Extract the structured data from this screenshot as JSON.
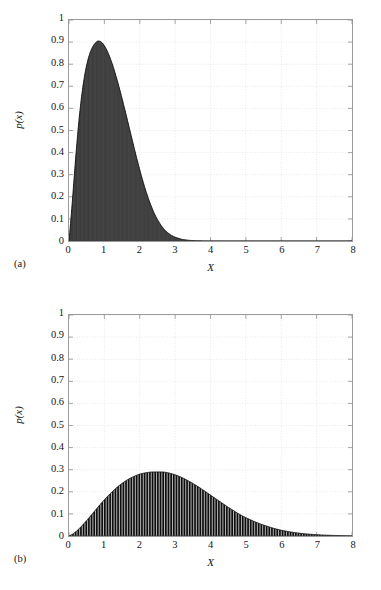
{
  "figure": {
    "background_color": "#ffffff",
    "ink_color": "#0d0d0d",
    "grid_color": "#d8d8d8",
    "axis_color": "#9a9a9a"
  },
  "panels": [
    {
      "tag": "(a)"
    },
    {
      "tag": "(b)"
    }
  ],
  "chart_data": [
    {
      "type": "area",
      "panel": "(a)",
      "title": "",
      "subtitle": "",
      "xlabel": "X",
      "ylabel": "p(x)",
      "xlim": [
        0,
        8
      ],
      "ylim": [
        0,
        1
      ],
      "xticks": [
        0,
        1,
        2,
        3,
        4,
        5,
        6,
        7,
        8
      ],
      "xticklabels": [
        "0",
        "1",
        "2",
        "3",
        "4",
        "5",
        "6",
        "7",
        "8"
      ],
      "yticks": [
        0,
        0.1,
        0.2,
        0.3,
        0.4,
        0.5,
        0.6,
        0.7,
        0.8,
        0.9,
        1
      ],
      "yticklabels": [
        "0",
        "0.1",
        "0.2",
        "0.3",
        "0.4",
        "0.5",
        "0.6",
        "0.7",
        "0.8",
        "0.9",
        "1"
      ],
      "grid": true,
      "legend": null,
      "fill": true,
      "peak": {
        "x": 0.81,
        "y": 0.905
      },
      "x": [
        0.0,
        0.05,
        0.1,
        0.15,
        0.2,
        0.25,
        0.3,
        0.35,
        0.4,
        0.45,
        0.5,
        0.55,
        0.6,
        0.65,
        0.7,
        0.75,
        0.8,
        0.85,
        0.9,
        0.95,
        1.0,
        1.05,
        1.1,
        1.15,
        1.2,
        1.25,
        1.3,
        1.35,
        1.4,
        1.45,
        1.5,
        1.55,
        1.6,
        1.65,
        1.7,
        1.75,
        1.8,
        1.85,
        1.9,
        1.95,
        2.0,
        2.05,
        2.1,
        2.15,
        2.2,
        2.25,
        2.3,
        2.35,
        2.4,
        2.45,
        2.5,
        2.6,
        2.7,
        2.8,
        2.9,
        3.0,
        3.2,
        3.4,
        3.6,
        3.8,
        4.0,
        4.5,
        5.0,
        5.5,
        6.0,
        6.5,
        7.0,
        7.5,
        8.0
      ],
      "y": [
        0.0,
        0.09,
        0.19,
        0.296,
        0.398,
        0.492,
        0.575,
        0.647,
        0.707,
        0.757,
        0.797,
        0.829,
        0.854,
        0.873,
        0.887,
        0.897,
        0.904,
        0.905,
        0.902,
        0.895,
        0.884,
        0.87,
        0.853,
        0.834,
        0.812,
        0.788,
        0.762,
        0.735,
        0.706,
        0.676,
        0.645,
        0.613,
        0.581,
        0.548,
        0.515,
        0.482,
        0.449,
        0.416,
        0.384,
        0.353,
        0.322,
        0.293,
        0.265,
        0.238,
        0.213,
        0.19,
        0.168,
        0.148,
        0.129,
        0.112,
        0.097,
        0.071,
        0.051,
        0.036,
        0.025,
        0.017,
        0.0072,
        0.0029,
        0.0011,
        0.0004,
        0.0001,
        0.0,
        0.0,
        0.0,
        0.0,
        0.0,
        0.0,
        0.0,
        0.0
      ]
    },
    {
      "type": "area",
      "panel": "(b)",
      "title": "",
      "subtitle": "",
      "xlabel": "X",
      "ylabel": "p(x)",
      "xlim": [
        0,
        8
      ],
      "ylim": [
        0,
        1
      ],
      "xticks": [
        0,
        1,
        2,
        3,
        4,
        5,
        6,
        7,
        8
      ],
      "xticklabels": [
        "0",
        "1",
        "2",
        "3",
        "4",
        "5",
        "6",
        "7",
        "8"
      ],
      "yticks": [
        0,
        0.1,
        0.2,
        0.3,
        0.4,
        0.5,
        0.6,
        0.7,
        0.8,
        0.9,
        1
      ],
      "yticklabels": [
        "0",
        "0.1",
        "0.2",
        "0.3",
        "0.4",
        "0.5",
        "0.6",
        "0.7",
        "0.8",
        "0.9",
        "1"
      ],
      "grid": true,
      "legend": null,
      "fill": true,
      "impulses": true,
      "peak": {
        "x": 2.7,
        "y": 0.29
      },
      "x": [
        0.0,
        0.1,
        0.2,
        0.3,
        0.4,
        0.5,
        0.6,
        0.7,
        0.8,
        0.9,
        1.0,
        1.1,
        1.2,
        1.3,
        1.4,
        1.5,
        1.6,
        1.7,
        1.8,
        1.9,
        2.0,
        2.1,
        2.2,
        2.3,
        2.4,
        2.5,
        2.6,
        2.7,
        2.8,
        2.9,
        3.0,
        3.1,
        3.2,
        3.3,
        3.4,
        3.5,
        3.6,
        3.7,
        3.8,
        3.9,
        4.0,
        4.1,
        4.2,
        4.3,
        4.4,
        4.5,
        4.6,
        4.7,
        4.8,
        4.9,
        5.0,
        5.2,
        5.4,
        5.6,
        5.8,
        6.0,
        6.2,
        6.4,
        6.6,
        6.8,
        7.0,
        7.2,
        7.4,
        7.6,
        7.8,
        8.0
      ],
      "y": [
        0.0,
        0.008,
        0.02,
        0.035,
        0.052,
        0.07,
        0.089,
        0.108,
        0.127,
        0.146,
        0.164,
        0.181,
        0.197,
        0.212,
        0.226,
        0.238,
        0.249,
        0.259,
        0.267,
        0.274,
        0.28,
        0.284,
        0.287,
        0.289,
        0.29,
        0.29,
        0.29,
        0.289,
        0.286,
        0.282,
        0.277,
        0.271,
        0.264,
        0.256,
        0.247,
        0.238,
        0.228,
        0.218,
        0.207,
        0.196,
        0.185,
        0.174,
        0.163,
        0.152,
        0.141,
        0.13,
        0.12,
        0.11,
        0.1,
        0.091,
        0.083,
        0.068,
        0.055,
        0.044,
        0.034,
        0.026,
        0.02,
        0.015,
        0.011,
        0.008,
        0.006,
        0.004,
        0.003,
        0.002,
        0.001,
        0.0
      ]
    }
  ]
}
